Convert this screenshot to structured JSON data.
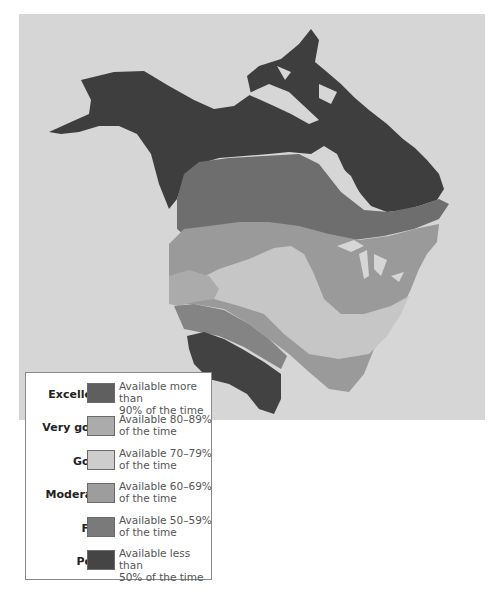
{
  "map": {
    "subject": "Resource availability across North America",
    "ocean_color": "#d6d6d6",
    "region_colors": {
      "excellent": "#5a5a5a",
      "very_good": "#a8a8a8",
      "good": "#c9c9c9",
      "moderate": "#9a9a9a",
      "fair": "#7c7c7c",
      "poor": "#3c3c3c"
    }
  },
  "legend": {
    "items": [
      {
        "label": "Excellent",
        "desc_line1": "Available more than",
        "desc_line2": "90% of the time",
        "color": "#5f5f5f"
      },
      {
        "label": "Very good",
        "desc_line1": "Available 80–89%",
        "desc_line2": "of the time",
        "color": "#ababab"
      },
      {
        "label": "Good",
        "desc_line1": "Available 70–79%",
        "desc_line2": "of the time",
        "color": "#cdcdcd"
      },
      {
        "label": "Moderate",
        "desc_line1": "Available 60–69%",
        "desc_line2": "of the time",
        "color": "#9d9d9d"
      },
      {
        "label": "Fair",
        "desc_line1": "Available 50–59%",
        "desc_line2": "of the time",
        "color": "#7a7a7a"
      },
      {
        "label": "Poor",
        "desc_line1": "Available less than",
        "desc_line2": "50% of the time",
        "color": "#454545"
      }
    ]
  }
}
